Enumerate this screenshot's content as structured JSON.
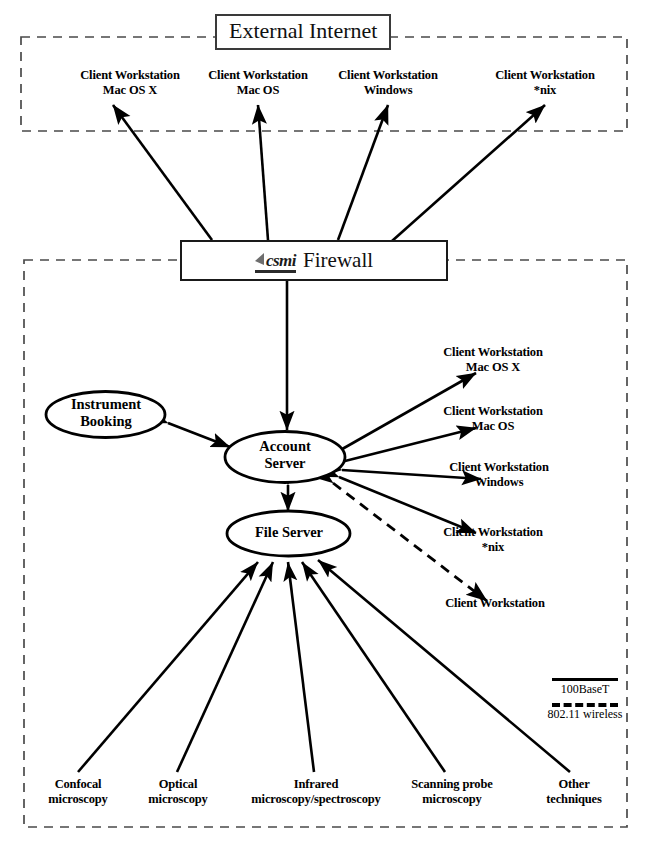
{
  "diagram": {
    "zones": {
      "external": {
        "label": "External Internet"
      },
      "internal": {
        "label": ""
      }
    },
    "firewall": {
      "logo_text": "csmi",
      "label": "Firewall",
      "logo_icon": "csmi-flag-logo"
    },
    "external_clients": [
      {
        "line1": "Client Workstation",
        "line2": "Mac OS X"
      },
      {
        "line1": "Client Workstation",
        "line2": "Mac OS"
      },
      {
        "line1": "Client Workstation",
        "line2": "Windows"
      },
      {
        "line1": "Client Workstation",
        "line2": "*nix"
      }
    ],
    "servers": [
      {
        "name": "instrument-booking",
        "line1": "Instrument",
        "line2": "Booking"
      },
      {
        "name": "account-server",
        "line1": "Account",
        "line2": "Server"
      },
      {
        "name": "file-server",
        "line1": "File Server",
        "line2": ""
      }
    ],
    "internal_clients": [
      {
        "line1": "Client Workstation",
        "line2": "Mac OS X",
        "link": "100BaseT"
      },
      {
        "line1": "Client Workstation",
        "line2": "Mac OS",
        "link": "100BaseT"
      },
      {
        "line1": "Client Workstation",
        "line2": "Windows",
        "link": "100BaseT"
      },
      {
        "line1": "Client Workstation",
        "line2": "*nix",
        "link": "100BaseT"
      },
      {
        "line1": "Client Workstation",
        "line2": "",
        "link": "802.11 wireless"
      }
    ],
    "instruments": [
      {
        "line1": "Confocal",
        "line2": "microscopy"
      },
      {
        "line1": "Optical",
        "line2": "microscopy"
      },
      {
        "line1": "Infrared",
        "line2": "microscopy/spectroscopy"
      },
      {
        "line1": "Scanning probe",
        "line2": "microscopy"
      },
      {
        "line1": "Other",
        "line2": "techniques"
      }
    ],
    "legend": [
      {
        "style": "solid",
        "label": "100BaseT"
      },
      {
        "style": "dashed",
        "label": "802.11 wireless"
      }
    ],
    "colors": {
      "line": "#000000",
      "box_border": "#1a1a1a",
      "dashed_zone": "#4a4a4a",
      "background": "#ffffff"
    }
  }
}
